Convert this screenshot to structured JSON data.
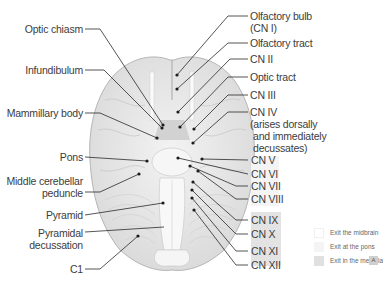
{
  "diagram": {
    "left_labels": [
      {
        "id": "optic-chiasm",
        "text": "Optic chiasm"
      },
      {
        "id": "infundibulum",
        "text": "Infundibulum"
      },
      {
        "id": "mammillary-body",
        "text": "Mammillary body"
      },
      {
        "id": "pons",
        "text": "Pons"
      },
      {
        "id": "middle-cerebellar-peduncle-1",
        "text": "Middle cerebellar"
      },
      {
        "id": "middle-cerebellar-peduncle-2",
        "text": "peduncle"
      },
      {
        "id": "pyramid",
        "text": "Pyramid"
      },
      {
        "id": "pyramidal-decussation-1",
        "text": "Pyramidal"
      },
      {
        "id": "pyramidal-decussation-2",
        "text": "decussation"
      },
      {
        "id": "c1",
        "text": "C1"
      }
    ],
    "right_labels": [
      {
        "id": "olfactory-bulb-1",
        "text": "Olfactory bulb"
      },
      {
        "id": "olfactory-bulb-2",
        "text": "(CN I)"
      },
      {
        "id": "olfactory-tract",
        "text": "Olfactory tract"
      },
      {
        "id": "cn-ii",
        "text": "CN II"
      },
      {
        "id": "optic-tract",
        "text": "Optic tract"
      },
      {
        "id": "cn-iii",
        "text": "CN III"
      },
      {
        "id": "cn-iv-1",
        "text": "CN IV"
      },
      {
        "id": "cn-iv-2",
        "text": "(arises dorsally"
      },
      {
        "id": "cn-iv-3",
        "text": "and immediately"
      },
      {
        "id": "cn-iv-4",
        "text": "decussates)"
      },
      {
        "id": "cn-v",
        "text": "CN V"
      },
      {
        "id": "cn-vi",
        "text": "CN VI"
      },
      {
        "id": "cn-vii",
        "text": "CN VII"
      },
      {
        "id": "cn-viii",
        "text": "CN VIII"
      },
      {
        "id": "cn-ix",
        "text": "CN IX"
      },
      {
        "id": "cn-x",
        "text": "CN X"
      },
      {
        "id": "cn-xi",
        "text": "CN XI"
      },
      {
        "id": "cn-xii",
        "text": "CN XII"
      }
    ]
  },
  "legend": {
    "items": [
      {
        "label": "Exit the midbrain",
        "color": "#ffffff"
      },
      {
        "label": "Exit at the pons",
        "color": "#f4f4f4"
      },
      {
        "label": "Exit in the medulla",
        "color": "#e0e0e0"
      }
    ],
    "badge": "A"
  },
  "colors": {
    "line": "#2a2a2a",
    "brain_fill": "#e8e8e8",
    "brain_stroke": "#b9b9b9",
    "pons_group_bg": "#f4f4f4",
    "medulla_group_bg": "#e3e3e3"
  }
}
